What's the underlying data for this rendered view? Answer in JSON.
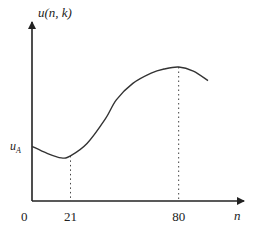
{
  "chart_data": {
    "type": "line",
    "title": "",
    "xlabel": "n",
    "ylabel": "u(n, k)",
    "origin_label": "0",
    "x_ticks": [
      {
        "value": 21,
        "label": "21"
      },
      {
        "value": 80,
        "label": "80"
      }
    ],
    "y_ticks": [
      {
        "value": 0.4,
        "label": "u_A",
        "label_main": "u",
        "label_sub": "A"
      }
    ],
    "xlim": [
      0,
      110
    ],
    "ylim": [
      0,
      1
    ],
    "grid": false,
    "series": [
      {
        "name": "u(n, k)",
        "x": [
          0,
          8,
          16,
          21,
          30,
          40,
          46,
          55,
          65,
          72,
          80,
          88,
          96
        ],
        "y": [
          0.4,
          0.35,
          0.315,
          0.33,
          0.42,
          0.6,
          0.74,
          0.86,
          0.935,
          0.965,
          0.98,
          0.95,
          0.88
        ]
      }
    ],
    "guides": [
      {
        "type": "vertical-dotted",
        "x": 21,
        "label": "21"
      },
      {
        "type": "vertical-dotted",
        "x": 80,
        "label": "80"
      }
    ],
    "colors": {
      "line": "#333333",
      "axis": "#222222"
    }
  }
}
